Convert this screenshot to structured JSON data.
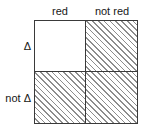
{
  "figure": {
    "type": "2x2-contingency-matrix",
    "background_color": "#ffffff",
    "border_color": "#3a3a3a",
    "hatch_color": "#8d8d8d"
  },
  "columns": [
    {
      "label": "red"
    },
    {
      "label": "not red"
    }
  ],
  "rows": [
    {
      "label": "Δ"
    },
    {
      "label": "not Δ"
    }
  ],
  "cells": [
    {
      "row": "Δ",
      "column": "red",
      "fill": "blank",
      "shaded": false
    },
    {
      "row": "Δ",
      "column": "not red",
      "fill": "hatched",
      "shaded": true
    },
    {
      "row": "not Δ",
      "column": "red",
      "fill": "hatched",
      "shaded": true
    },
    {
      "row": "not Δ",
      "column": "not red",
      "fill": "hatched",
      "shaded": true
    }
  ]
}
